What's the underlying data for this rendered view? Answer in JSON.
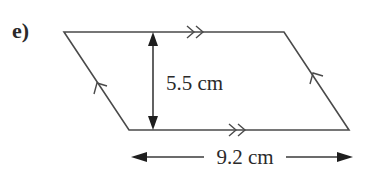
{
  "question": {
    "part_label": "e)"
  },
  "shape": {
    "type": "parallelogram",
    "vertices": {
      "top_left": [
        64,
        32
      ],
      "top_right": [
        284,
        32
      ],
      "bottom_right": [
        349,
        130
      ],
      "bottom_left": [
        129,
        130
      ]
    },
    "stroke_color": "#4a4a4a"
  },
  "measurements": {
    "height": {
      "label": "5.5 cm",
      "value": 5.5,
      "unit": "cm"
    },
    "base": {
      "label": "9.2 cm",
      "value": 9.2,
      "unit": "cm"
    }
  },
  "markings": {
    "parallel_horizontal": "double-arrow",
    "parallel_slanted": "single-arrow"
  },
  "colors": {
    "line": "#4a4a4a",
    "arrowhead": "#1e1e1e",
    "text": "#2a2a2a"
  }
}
